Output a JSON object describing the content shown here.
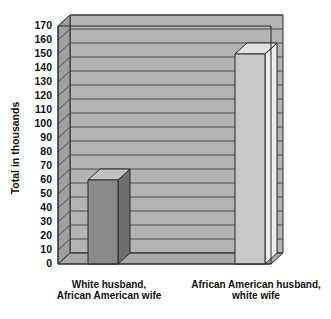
{
  "chart_data": {
    "type": "bar",
    "title": "",
    "subtitle": "",
    "xlabel": "",
    "ylabel": "Total in thousands",
    "ylim": [
      0,
      170
    ],
    "ytick_step": 10,
    "grid": true,
    "legend": "none",
    "style": "3d-bar",
    "categories": [
      "White  husband,\nAfrican American wife",
      "African American husband,\nwhite wife"
    ],
    "category_lines": [
      [
        "White  husband,",
        "African American wife"
      ],
      [
        "African American husband,",
        "white wife"
      ]
    ],
    "values": [
      60,
      150
    ],
    "yticks": [
      "170",
      "160",
      "150",
      "140",
      "130",
      "120",
      "110",
      "100",
      "90",
      "80",
      "70",
      "60",
      "50",
      "40",
      "30",
      "20",
      "10",
      "0"
    ],
    "bar_colors": [
      "#8a8a8a",
      "#c9c9c9"
    ],
    "bar_top_colors": [
      "#c2c2c2",
      "#e2e2e2"
    ],
    "bar_side_colors": [
      "#6f6f6f",
      "#ededed"
    ],
    "wall_color": "#b3b3b3",
    "floor_color": "#a8a8a8",
    "gridline_color": "#4a4a4a",
    "outline_color": "#2b2b2b",
    "background_color": "#ffffff"
  }
}
